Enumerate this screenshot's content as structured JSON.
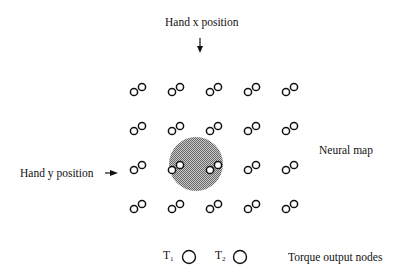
{
  "labels": {
    "hand_x": "Hand x position",
    "hand_y": "Hand y position",
    "neural_map": "Neural map",
    "torque_nodes": "Torque output nodes",
    "t1_base": "T",
    "t1_sub": "1",
    "t2_base": "T",
    "t2_sub": "2"
  },
  "grid": {
    "columns": [
      134,
      172,
      210,
      248,
      286
    ],
    "rows": [
      92,
      131,
      170,
      209
    ],
    "small_node_radius": 3.6,
    "pair_offset": [
      8,
      -5
    ]
  },
  "activation_region": {
    "cx": 196,
    "cy": 164,
    "r": 27,
    "color": "#9a9a9a"
  },
  "torque_nodes": [
    {
      "name": "T1",
      "cx": 189,
      "cy": 257,
      "r": 6.5
    },
    {
      "name": "T2",
      "cx": 240,
      "cy": 257,
      "r": 6.5
    }
  ],
  "colors": {
    "stroke": "#111111",
    "background": "#ffffff"
  }
}
